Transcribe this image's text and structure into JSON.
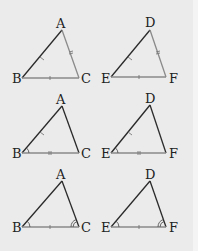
{
  "colors": {
    "background": "#ebebeb",
    "edge_dark": "#2a2a2a",
    "edge_gray": "#8a8a8a",
    "tick": "#777777"
  },
  "rows": [
    {
      "name": "SSS",
      "left": {
        "labels": {
          "top": "A",
          "left": "B",
          "right": "C"
        },
        "marks": {
          "left_side": "single-tick",
          "right_side": "double-tick",
          "base": "single-tick"
        }
      },
      "right": {
        "labels": {
          "top": "D",
          "left": "E",
          "right": "F"
        },
        "marks": {
          "left_side": "single-tick",
          "right_side": "double-tick",
          "base": "single-tick"
        }
      }
    },
    {
      "name": "SAS",
      "left": {
        "labels": {
          "top": "A",
          "left": "B",
          "right": "C"
        },
        "marks": {
          "left_side": "single-tick",
          "base": "double-tick",
          "left_angle": "arc"
        }
      },
      "right": {
        "labels": {
          "top": "D",
          "left": "E",
          "right": "F"
        },
        "marks": {
          "left_side": "single-tick",
          "base": "double-tick",
          "left_angle": "arc"
        }
      }
    },
    {
      "name": "ASA",
      "left": {
        "labels": {
          "top": "A",
          "left": "B",
          "right": "C"
        },
        "marks": {
          "base": "single-tick",
          "left_angle": "arc",
          "right_angle": "double-arc"
        }
      },
      "right": {
        "labels": {
          "top": "D",
          "left": "E",
          "right": "F"
        },
        "marks": {
          "base": "single-tick",
          "left_angle": "arc",
          "right_angle": "double-arc"
        }
      }
    }
  ]
}
